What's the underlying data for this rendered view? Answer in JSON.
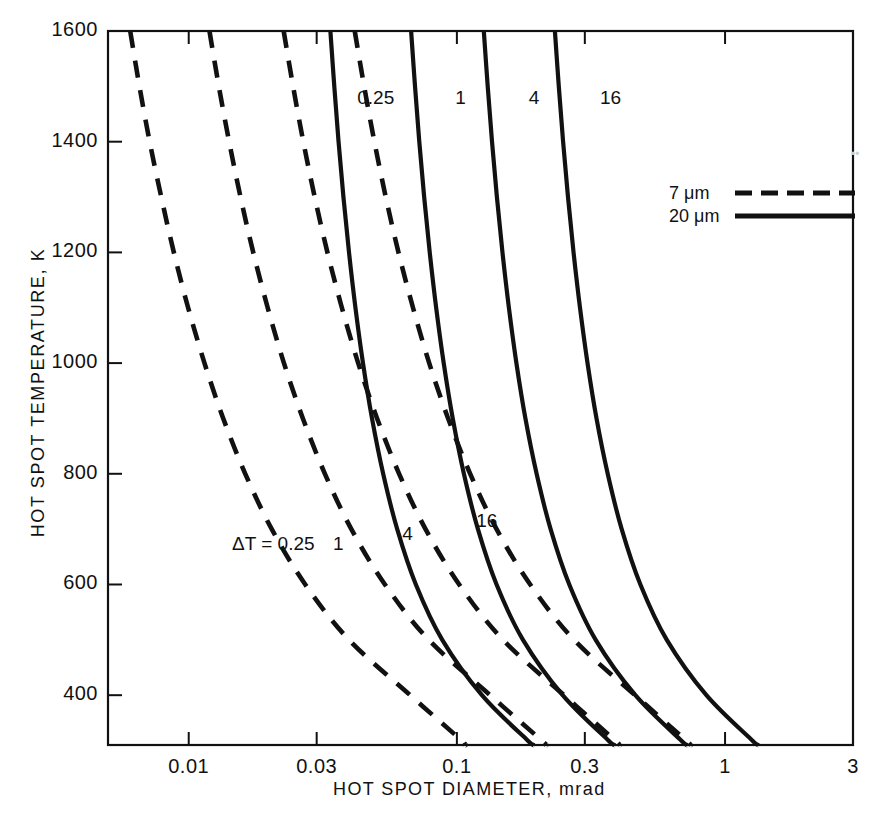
{
  "chart_data": {
    "type": "line",
    "title": "",
    "xlabel": "HOT SPOT DIAMETER, mrad",
    "ylabel": "HOT SPOT TEMPERATURE, K",
    "xscale": "log",
    "xlim": [
      0.005,
      3
    ],
    "ylim": [
      310,
      1600
    ],
    "grid": false,
    "xticks": [
      0.01,
      0.03,
      0.1,
      0.3,
      1,
      3
    ],
    "xtick_labels": [
      "0.01",
      "0.03",
      "0.1",
      "0.3",
      "1",
      "3"
    ],
    "yticks": [
      400,
      600,
      800,
      1000,
      1200,
      1400,
      1600
    ],
    "ytick_labels": [
      "400",
      "600",
      "800",
      "1000",
      "1200",
      "1400",
      "1600"
    ],
    "legend_position": "upper right",
    "legend": [
      {
        "label": "7 μm",
        "style": "dashed"
      },
      {
        "label": "20 μm",
        "style": "solid"
      }
    ],
    "annotations": [
      {
        "text": "ΔT = 0.25",
        "x": 0.0145,
        "y": 672
      },
      {
        "text": "1",
        "x": 0.0345,
        "y": 672
      },
      {
        "text": "4",
        "x": 0.0625,
        "y": 690
      },
      {
        "text": "16",
        "x": 0.118,
        "y": 712
      },
      {
        "text": "0.25",
        "x": 0.0425,
        "y": 1478
      },
      {
        "text": "1",
        "x": 0.0985,
        "y": 1478
      },
      {
        "text": "4",
        "x": 0.1855,
        "y": 1478
      },
      {
        "text": "16",
        "x": 0.3415,
        "y": 1478
      }
    ],
    "series": [
      {
        "name": "7 μm, ΔT = 0.25",
        "style": "dashed",
        "delta_t": 0.25,
        "wavelength_um": 7,
        "points": [
          [
            0.00605,
            1600
          ],
          [
            0.00655,
            1500
          ],
          [
            0.00715,
            1400
          ],
          [
            0.0079,
            1300
          ],
          [
            0.0088,
            1200
          ],
          [
            0.00995,
            1100
          ],
          [
            0.01145,
            1000
          ],
          [
            0.01345,
            900
          ],
          [
            0.01625,
            800
          ],
          [
            0.0204,
            700
          ],
          [
            0.0272,
            600
          ],
          [
            0.0396,
            500
          ],
          [
            0.067,
            400
          ],
          [
            0.103,
            320
          ],
          [
            0.107,
            310
          ]
        ]
      },
      {
        "name": "7 μm, ΔT = 1",
        "style": "dashed",
        "delta_t": 1,
        "wavelength_um": 7,
        "points": [
          [
            0.01195,
            1600
          ],
          [
            0.01295,
            1500
          ],
          [
            0.01415,
            1400
          ],
          [
            0.0156,
            1300
          ],
          [
            0.0174,
            1200
          ],
          [
            0.0197,
            1100
          ],
          [
            0.02265,
            1000
          ],
          [
            0.02665,
            900
          ],
          [
            0.0322,
            800
          ],
          [
            0.0404,
            700
          ],
          [
            0.0539,
            600
          ],
          [
            0.0785,
            500
          ],
          [
            0.133,
            400
          ],
          [
            0.205,
            320
          ],
          [
            0.215,
            310
          ]
        ]
      },
      {
        "name": "7 μm, ΔT = 4",
        "style": "dashed",
        "delta_t": 4,
        "wavelength_um": 7,
        "points": [
          [
            0.0226,
            1600
          ],
          [
            0.0245,
            1500
          ],
          [
            0.02675,
            1400
          ],
          [
            0.0295,
            1300
          ],
          [
            0.0329,
            1200
          ],
          [
            0.03725,
            1100
          ],
          [
            0.04285,
            1000
          ],
          [
            0.0504,
            900
          ],
          [
            0.0609,
            800
          ],
          [
            0.0764,
            700
          ],
          [
            0.102,
            600
          ],
          [
            0.1485,
            500
          ],
          [
            0.251,
            400
          ],
          [
            0.385,
            320
          ],
          [
            0.405,
            310
          ]
        ]
      },
      {
        "name": "7 μm, ΔT = 16",
        "style": "dashed",
        "delta_t": 16,
        "wavelength_um": 7,
        "points": [
          [
            0.0416,
            1600
          ],
          [
            0.0451,
            1500
          ],
          [
            0.04925,
            1400
          ],
          [
            0.0543,
            1300
          ],
          [
            0.06055,
            1200
          ],
          [
            0.0686,
            1100
          ],
          [
            0.07885,
            1000
          ],
          [
            0.09275,
            900
          ],
          [
            0.1121,
            800
          ],
          [
            0.1406,
            700
          ],
          [
            0.1877,
            600
          ],
          [
            0.2733,
            500
          ],
          [
            0.462,
            400
          ],
          [
            0.708,
            320
          ],
          [
            0.745,
            310
          ]
        ]
      },
      {
        "name": "20 μm, ΔT = 0.25",
        "style": "solid",
        "delta_t": 0.25,
        "wavelength_um": 20,
        "points": [
          [
            0.03375,
            1600
          ],
          [
            0.0349,
            1500
          ],
          [
            0.0362,
            1400
          ],
          [
            0.03775,
            1300
          ],
          [
            0.0396,
            1200
          ],
          [
            0.04185,
            1100
          ],
          [
            0.04465,
            1000
          ],
          [
            0.04825,
            900
          ],
          [
            0.0531,
            800
          ],
          [
            0.0599,
            700
          ],
          [
            0.0703,
            600
          ],
          [
            0.0882,
            500
          ],
          [
            0.124,
            400
          ],
          [
            0.182,
            320
          ],
          [
            0.194,
            310
          ]
        ]
      },
      {
        "name": "20 μm, ΔT = 1",
        "style": "solid",
        "delta_t": 1,
        "wavelength_um": 20,
        "points": [
          [
            0.0675,
            1600
          ],
          [
            0.0698,
            1500
          ],
          [
            0.0724,
            1400
          ],
          [
            0.0755,
            1300
          ],
          [
            0.0792,
            1200
          ],
          [
            0.0837,
            1100
          ],
          [
            0.0893,
            1000
          ],
          [
            0.0965,
            900
          ],
          [
            0.1062,
            800
          ],
          [
            0.1198,
            700
          ],
          [
            0.1406,
            600
          ],
          [
            0.1764,
            500
          ],
          [
            0.248,
            400
          ],
          [
            0.364,
            320
          ],
          [
            0.388,
            310
          ]
        ]
      },
      {
        "name": "20 μm, ΔT = 4",
        "style": "solid",
        "delta_t": 4,
        "wavelength_um": 20,
        "points": [
          [
            0.126,
            1600
          ],
          [
            0.1303,
            1500
          ],
          [
            0.1352,
            1400
          ],
          [
            0.141,
            1300
          ],
          [
            0.1479,
            1200
          ],
          [
            0.1563,
            1100
          ],
          [
            0.1667,
            1000
          ],
          [
            0.1801,
            900
          ],
          [
            0.1983,
            800
          ],
          [
            0.2236,
            700
          ],
          [
            0.2625,
            600
          ],
          [
            0.3293,
            500
          ],
          [
            0.463,
            400
          ],
          [
            0.68,
            320
          ],
          [
            0.724,
            310
          ]
        ]
      },
      {
        "name": "20 μm, ΔT = 16",
        "style": "solid",
        "delta_t": 16,
        "wavelength_um": 20,
        "points": [
          [
            0.232,
            1600
          ],
          [
            0.2399,
            1500
          ],
          [
            0.2489,
            1400
          ],
          [
            0.2596,
            1300
          ],
          [
            0.2723,
            1200
          ],
          [
            0.2878,
            1100
          ],
          [
            0.307,
            1000
          ],
          [
            0.3316,
            900
          ],
          [
            0.3651,
            800
          ],
          [
            0.4117,
            700
          ],
          [
            0.4833,
            600
          ],
          [
            0.6064,
            500
          ],
          [
            0.852,
            400
          ],
          [
            1.252,
            320
          ],
          [
            1.333,
            310
          ]
        ]
      }
    ]
  }
}
